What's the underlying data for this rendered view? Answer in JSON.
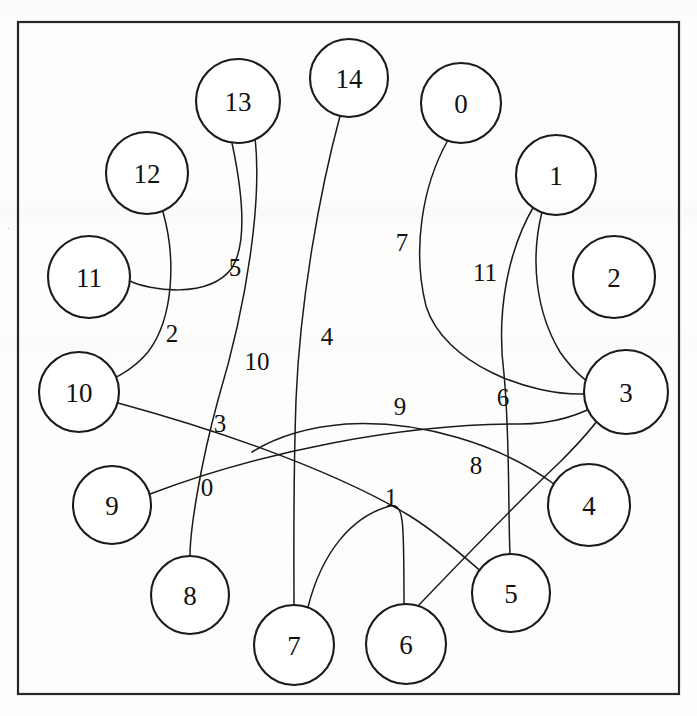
{
  "figure": {
    "kind": "undirected-graph-drawing",
    "width": 697,
    "height": 716,
    "background_color": "#fdfdfb",
    "ink_color": "#1a1a1a",
    "frame_color": "#262626"
  },
  "frame": {
    "x": 18,
    "y": 22,
    "width": 661,
    "height": 672
  },
  "nodes": [
    {
      "id": "0",
      "label": "0",
      "cx": 461,
      "cy": 103,
      "r": 40
    },
    {
      "id": "1",
      "label": "1",
      "cx": 556,
      "cy": 175,
      "r": 40
    },
    {
      "id": "2",
      "label": "2",
      "cx": 614,
      "cy": 277,
      "r": 41
    },
    {
      "id": "3",
      "label": "3",
      "cx": 626,
      "cy": 392,
      "r": 42
    },
    {
      "id": "4",
      "label": "4",
      "cx": 589,
      "cy": 505,
      "r": 41
    },
    {
      "id": "5",
      "label": "5",
      "cx": 511,
      "cy": 593,
      "r": 39
    },
    {
      "id": "6",
      "label": "6",
      "cx": 406,
      "cy": 644,
      "r": 40
    },
    {
      "id": "7",
      "label": "7",
      "cx": 294,
      "cy": 645,
      "r": 40
    },
    {
      "id": "8",
      "label": "8",
      "cx": 190,
      "cy": 595,
      "r": 39
    },
    {
      "id": "9",
      "label": "9",
      "cx": 112,
      "cy": 505,
      "r": 39
    },
    {
      "id": "10",
      "label": "10",
      "cx": 79,
      "cy": 392,
      "r": 40
    },
    {
      "id": "11",
      "label": "11",
      "cx": 89,
      "cy": 277,
      "r": 41
    },
    {
      "id": "12",
      "label": "12",
      "cx": 147,
      "cy": 173,
      "r": 41
    },
    {
      "id": "13",
      "label": "13",
      "cx": 238,
      "cy": 101,
      "r": 42
    },
    {
      "id": "14",
      "label": "14",
      "cx": 349,
      "cy": 78,
      "r": 39
    }
  ],
  "edges": [
    {
      "label": "0",
      "source": "9",
      "target": "3",
      "label_x": 207,
      "label_y": 487,
      "path": "M 150 494 C 260 452 400 424 520 424 C 560 424 590 410 606 400"
    },
    {
      "label": "1",
      "source": "7",
      "target": "6",
      "label_x": 391,
      "label_y": 497,
      "path": "M 308 607 C 322 552 352 516 390 506 C 404 504 404 518 404 604"
    },
    {
      "label": "2",
      "source": "12",
      "target": "10",
      "label_x": 172,
      "label_y": 333,
      "path": "M 163 212 C 176 258 174 318 148 352 C 130 374 106 382 92 387"
    },
    {
      "label": "3",
      "source": "10",
      "target": "5",
      "label_x": 220,
      "label_y": 423,
      "path": "M 118 403 C 210 428 330 468 410 516 C 448 540 478 570 489 578"
    },
    {
      "label": "4",
      "source": "14",
      "target": "7",
      "label_x": 327,
      "label_y": 336,
      "path": "M 340 116 C 320 190 300 300 296 400 C 293 488 294 560 294 605"
    },
    {
      "label": "5",
      "source": "13",
      "target": "11",
      "label_x": 235,
      "label_y": 267,
      "path": "M 232 143 C 242 190 248 242 232 268 C 208 300 148 290 130 281"
    },
    {
      "label": "6",
      "source": "1",
      "target": "5",
      "label_x": 503,
      "label_y": 397,
      "path": "M 534 206 C 508 250 496 312 504 374 C 510 438 508 510 510 554"
    },
    {
      "label": "7",
      "source": "0",
      "target": "3",
      "label_x": 402,
      "label_y": 242,
      "path": "M 448 140 C 422 186 412 250 426 306 C 444 364 530 396 585 394"
    },
    {
      "label": "8",
      "source": "6",
      "target": "3",
      "label_x": 476,
      "label_y": 465,
      "path": "M 418 606 C 462 560 520 500 560 462 C 586 436 600 418 606 408"
    },
    {
      "label": "9",
      "source": "4",
      "target": "7",
      "label_x": 400,
      "label_y": 406,
      "path": "M 554 484 C 500 444 420 420 346 424 C 296 428 268 442 252 452"
    },
    {
      "label": "10",
      "source": "13",
      "target": "8",
      "label_x": 257,
      "label_y": 361,
      "path": "M 255 137 C 262 200 248 300 218 400 C 200 466 190 530 190 556"
    },
    {
      "label": "11",
      "source": "1",
      "target": "3",
      "label_x": 485,
      "label_y": 272,
      "path": "M 542 212 C 530 260 536 312 560 352 C 578 378 596 388 604 392"
    }
  ]
}
